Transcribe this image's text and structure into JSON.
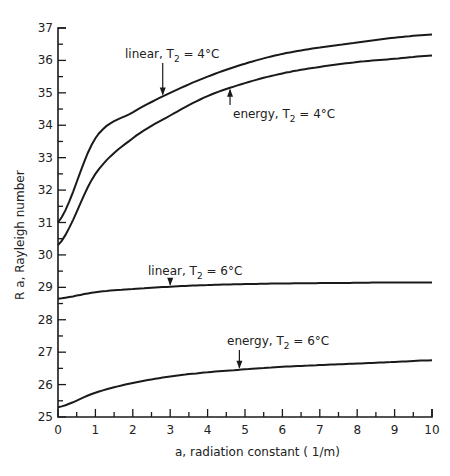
{
  "chart_data": {
    "type": "line",
    "title": "",
    "xlabel": "a, radiation constant (1/m)",
    "ylabel": "R a, Rayleigh number",
    "xlim": [
      0,
      10
    ],
    "ylim": [
      25,
      37
    ],
    "grid": false,
    "legend": "inline annotations with arrows",
    "x_ticks": [
      0,
      1,
      2,
      3,
      4,
      5,
      6,
      7,
      8,
      9,
      10
    ],
    "y_ticks": [
      25,
      26,
      27,
      28,
      29,
      30,
      31,
      32,
      33,
      34,
      35,
      36,
      37
    ],
    "x": [
      0,
      1,
      2,
      3,
      4,
      5,
      6,
      7,
      8,
      9,
      10
    ],
    "series": [
      {
        "name": "linear, T2 = 4°C",
        "values": [
          31.0,
          33.6,
          34.4,
          35.0,
          35.5,
          35.9,
          36.2,
          36.4,
          36.55,
          36.7,
          36.8
        ]
      },
      {
        "name": "energy, T2 = 4°C",
        "values": [
          30.3,
          32.5,
          33.6,
          34.3,
          34.9,
          35.3,
          35.6,
          35.8,
          35.95,
          36.05,
          36.15
        ]
      },
      {
        "name": "linear, T2 = 6°C",
        "values": [
          28.65,
          28.85,
          28.95,
          29.02,
          29.07,
          29.1,
          29.12,
          29.13,
          29.14,
          29.15,
          29.15
        ]
      },
      {
        "name": "energy, T2 = 6°C",
        "values": [
          25.3,
          25.75,
          26.05,
          26.25,
          26.38,
          26.47,
          26.55,
          26.6,
          26.65,
          26.7,
          26.75
        ]
      }
    ],
    "annotations": [
      {
        "text_main": "linear, T",
        "sub": "2",
        "rest": " = 4°C",
        "arrow_x": 2.8,
        "direction": "down"
      },
      {
        "text_main": "energy, T",
        "sub": "2",
        "rest": " = 4°C",
        "arrow_x": 4.6,
        "direction": "up"
      },
      {
        "text_main": "linear, T",
        "sub": "2",
        "rest": " = 6°C",
        "arrow_x": 3.0,
        "direction": "down"
      },
      {
        "text_main": "energy, T",
        "sub": "2",
        "rest": " = 6°C",
        "arrow_x": 4.85,
        "direction": "down"
      }
    ]
  },
  "labels": {
    "xlabel_main": "a, radiation constant ( ",
    "xlabel_unit": "1/m",
    "xlabel_end": ")",
    "ylabel": "R a,  Rayleigh number"
  }
}
